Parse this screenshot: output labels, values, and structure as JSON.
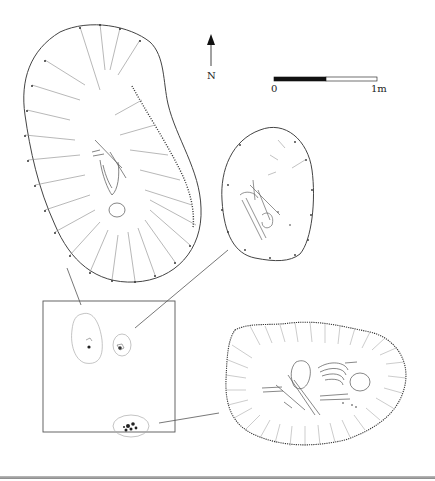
{
  "figure": {
    "type": "archaeological site plan",
    "north_arrow": {
      "label": "N"
    },
    "scale_bar": {
      "start_label": "0",
      "end_label": "1m"
    },
    "overview_panel": {
      "features": [
        {
          "id": "upper-left-grave",
          "links_to": "large-north-grave"
        },
        {
          "id": "upper-right-grave",
          "links_to": "oval-east-grave"
        },
        {
          "id": "lower-grave",
          "links_to": "south-east-grave"
        }
      ]
    },
    "details": [
      {
        "id": "large-north-grave",
        "content": "hachured pit with skeletal remains"
      },
      {
        "id": "oval-east-grave",
        "content": "oval pit with disarticulated bones"
      },
      {
        "id": "south-east-grave",
        "content": "hachured pit with crouched skeleton"
      }
    ],
    "colors": {
      "ink": "#333333",
      "light_ink": "#888888",
      "background": "#ffffff"
    }
  }
}
